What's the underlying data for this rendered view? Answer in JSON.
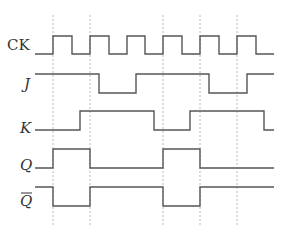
{
  "diagram": {
    "type": "timing-diagram",
    "title": "",
    "colors": {
      "wave": "#555555",
      "guide": "#b8b8b8",
      "label": "#333333"
    },
    "guides": {
      "x": [
        53,
        90,
        163,
        200,
        237
      ],
      "y_top": 15,
      "y_bottom": 225
    },
    "signals": [
      {
        "name": "CK",
        "label": "CK",
        "italic": false,
        "overbar": false,
        "label_pos": [
          7,
          50
        ],
        "high_y": 36,
        "low_y": 54,
        "start_x": 35,
        "end_x": 274,
        "initial": 0,
        "transitions": [
          53,
          72,
          90,
          109,
          127,
          145,
          163,
          182,
          200,
          219,
          237,
          256
        ]
      },
      {
        "name": "J",
        "label": "J",
        "italic": true,
        "overbar": false,
        "label_pos": [
          24,
          89
        ],
        "high_y": 74,
        "low_y": 93,
        "start_x": 35,
        "end_x": 274,
        "initial": 1,
        "transitions": [
          99,
          136,
          209,
          247
        ]
      },
      {
        "name": "K",
        "label": "K",
        "italic": true,
        "overbar": false,
        "label_pos": [
          20,
          133
        ],
        "high_y": 111,
        "low_y": 130,
        "start_x": 35,
        "end_x": 274,
        "initial": 0,
        "transitions": [
          80,
          154,
          190,
          264
        ]
      },
      {
        "name": "Q",
        "label": "Q",
        "italic": true,
        "overbar": false,
        "label_pos": [
          20,
          170
        ],
        "high_y": 149,
        "low_y": 168,
        "start_x": 35,
        "end_x": 274,
        "initial": 0,
        "transitions": [
          53,
          90,
          163,
          200
        ]
      },
      {
        "name": "Q-bar",
        "label": "Q",
        "italic": true,
        "overbar": true,
        "label_pos": [
          20,
          206
        ],
        "high_y": 187,
        "low_y": 206,
        "start_x": 35,
        "end_x": 274,
        "initial": 1,
        "transitions": [
          53,
          90,
          163,
          200
        ]
      }
    ]
  }
}
